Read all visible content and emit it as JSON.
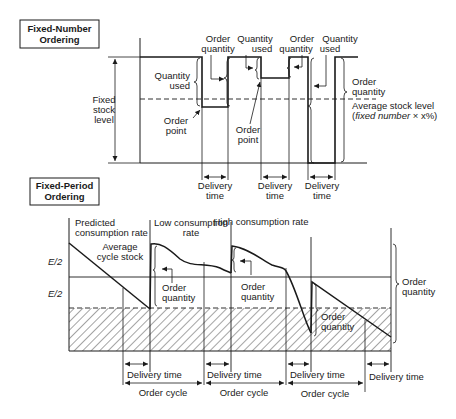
{
  "fixed_number": {
    "title_line1": "Fixed-Number",
    "title_line2": "Ordering",
    "fixed_stock_level": [
      "Fixed",
      "stock",
      "level"
    ],
    "quantity_used_left": [
      "Quantity",
      "used"
    ],
    "order_point_left": [
      "Order",
      "point"
    ],
    "order_quantity_1": [
      "Order",
      "quantity"
    ],
    "quantity_used_1": [
      "Quantity",
      "used"
    ],
    "order_point_center": [
      "Order",
      "point"
    ],
    "order_quantity_2": [
      "Order",
      "quantity"
    ],
    "quantity_used_2": [
      "Quantity",
      "used"
    ],
    "order_quantity_right": [
      "Order",
      "quantity"
    ],
    "average_stock_level": "Average stock level",
    "average_formula_open": "(",
    "average_formula_italic": "fixed number",
    "average_formula_rest": " × x%)",
    "delivery_time": [
      "Delivery",
      "time"
    ]
  },
  "fixed_period": {
    "title_line1": "Fixed-Period",
    "title_line2": "Ordering",
    "predicted_rate": [
      "Predicted",
      "consumption rate"
    ],
    "average_cycle_stock": [
      "Average",
      "cycle stock"
    ],
    "low_rate": [
      "Low consumption",
      "rate"
    ],
    "high_rate": "High consumption rate",
    "e_half_upper": "E/2",
    "e_half_lower": "E/2",
    "order_quantity": [
      "Order",
      "quantity"
    ],
    "order_quantity_right": [
      "Order",
      "quantity"
    ],
    "delivery_time": "Delivery time",
    "order_cycle": "Order cycle"
  },
  "colors": {
    "ink": "#1a1a1a",
    "background": "#ffffff"
  }
}
